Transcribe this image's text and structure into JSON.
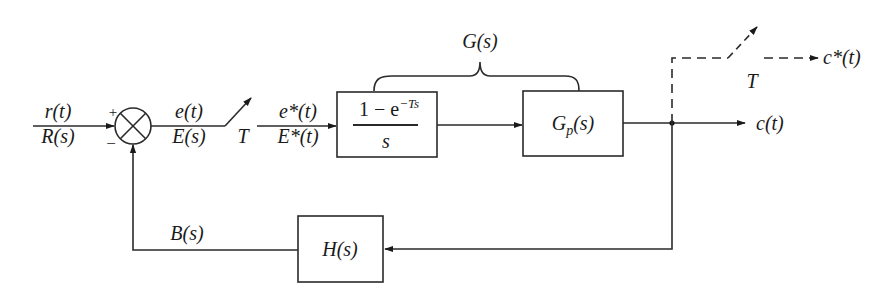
{
  "diagram": {
    "type": "sampled-data feedback control block diagram",
    "input": {
      "time": "r(t)",
      "laplace": "R(s)"
    },
    "summing_junction": {
      "plus_sign": "+",
      "minus_sign": "−"
    },
    "error": {
      "time": "e(t)",
      "laplace": "E(s)"
    },
    "sampler_in": {
      "period_label": "T"
    },
    "sampled_error": {
      "time": "e*(t)",
      "laplace": "E*(t)"
    },
    "zoh_block": {
      "numerator_prefix": "1 − e",
      "numerator_exponent": "−Ts",
      "denominator": "s"
    },
    "plant_block": {
      "label_main": "G",
      "label_sub": "p",
      "label_suffix": "(s)"
    },
    "group_brace_label": "G(s)",
    "output": {
      "time": "c(t)"
    },
    "sampler_out": {
      "period_label": "T",
      "output": "c*(t)"
    },
    "feedback_block": {
      "label": "H(s)"
    },
    "feedback_signal": {
      "laplace": "B(s)"
    }
  }
}
